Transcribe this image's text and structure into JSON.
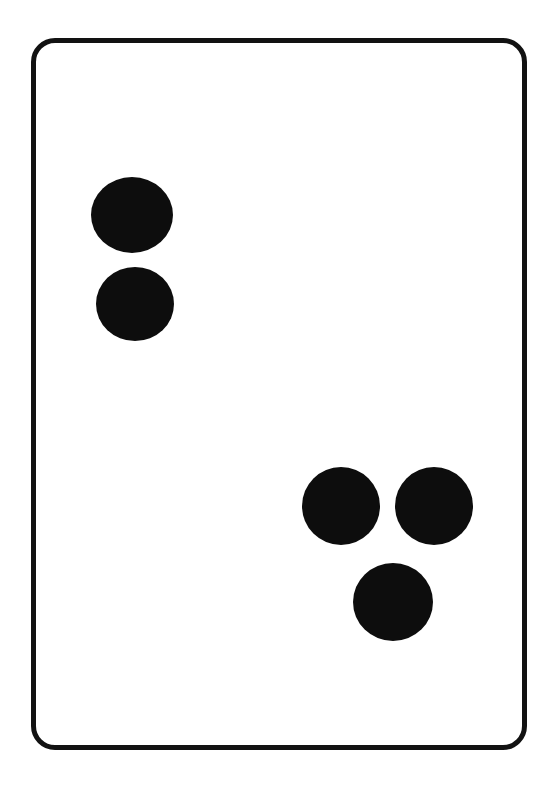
{
  "canvas": {
    "width": 559,
    "height": 791,
    "background_color": "#ffffff"
  },
  "card": {
    "name": "domino-tile",
    "shape": "rounded-rectangle",
    "x": 31,
    "y": 38,
    "width": 496,
    "height": 712,
    "corner_radius": 24,
    "border_width": 5,
    "border_color": "#121212",
    "fill_color": "#ffffff"
  },
  "pips": {
    "total_count": 5,
    "color": "#0d0d0d",
    "groups": [
      {
        "name": "upper-left-group",
        "count": 2,
        "items": [
          {
            "label": "pip-1",
            "cx": 127,
            "cy": 210,
            "rx": 41,
            "ry": 38
          },
          {
            "label": "pip-2",
            "cx": 130,
            "cy": 299,
            "rx": 39,
            "ry": 37
          }
        ]
      },
      {
        "name": "lower-right-group",
        "count": 3,
        "items": [
          {
            "label": "pip-3",
            "cx": 336,
            "cy": 501,
            "rx": 39,
            "ry": 39
          },
          {
            "label": "pip-4",
            "cx": 429,
            "cy": 501,
            "rx": 39,
            "ry": 39
          },
          {
            "label": "pip-5",
            "cx": 388,
            "cy": 597,
            "rx": 40,
            "ry": 39
          }
        ]
      }
    ]
  }
}
